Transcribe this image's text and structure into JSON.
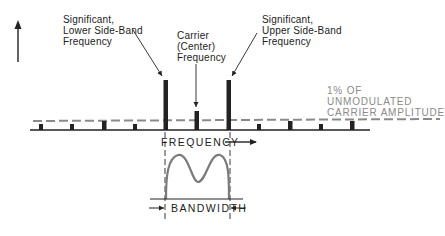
{
  "diagram": {
    "y_axis_label": "AMPLITUDE",
    "x_axis_label": "FREQUENCY",
    "labels": {
      "lower_sideband": "Significant,\nLower Side-Band\nFrequency",
      "carrier": "Carrier\n(Center)\nFrequency",
      "upper_sideband": "Significant,\nUpper Side-Band\nFrequency",
      "threshold": "1% OF\nUNMODULATED\nCARRIER AMPLITUDE",
      "bandwidth": "BANDWIDTH"
    },
    "colors": {
      "ink": "#222222",
      "threshold_dash": "#8a8a8a",
      "response_curve": "#7a7a7a"
    },
    "spectral_lines": [
      {
        "x": 41,
        "height": "small"
      },
      {
        "x": 72,
        "height": "small"
      },
      {
        "x": 104,
        "height": "medium"
      },
      {
        "x": 135,
        "height": "small"
      },
      {
        "x": 165,
        "height": "significant-lower"
      },
      {
        "x": 196,
        "height": "carrier"
      },
      {
        "x": 228,
        "height": "significant-upper"
      },
      {
        "x": 259,
        "height": "small"
      },
      {
        "x": 290,
        "height": "medium"
      },
      {
        "x": 321,
        "height": "small"
      },
      {
        "x": 352,
        "height": "medium"
      }
    ]
  }
}
